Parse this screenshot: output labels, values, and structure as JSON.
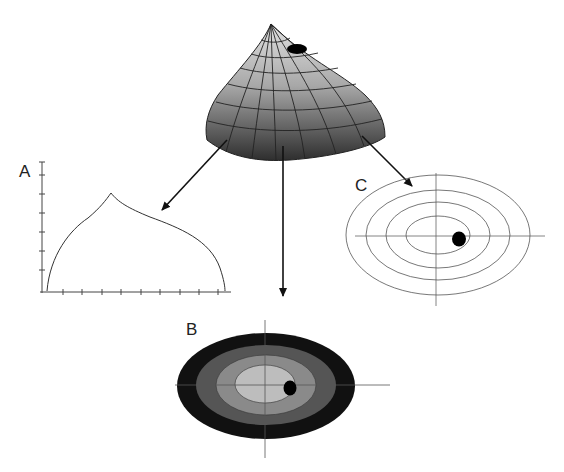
{
  "labels": {
    "a": "A",
    "b": "B",
    "c": "C"
  },
  "colors": {
    "surface_light": "#d6d6d6",
    "surface_dark": "#3a3a3a",
    "grid_line": "#222222",
    "contour_outer": "#111111",
    "contour_2": "#555555",
    "contour_3": "#8a8a8a",
    "contour_inner": "#bdbdbd",
    "point": "#000000"
  },
  "panels": [
    {
      "id": "surface",
      "description": "3D surface with mesh grid and marked point"
    },
    {
      "id": "A",
      "description": "1D profile curve on axes"
    },
    {
      "id": "B",
      "description": "Filled contour plot with marked point"
    },
    {
      "id": "C",
      "description": "Line contour plot with marked point"
    }
  ]
}
